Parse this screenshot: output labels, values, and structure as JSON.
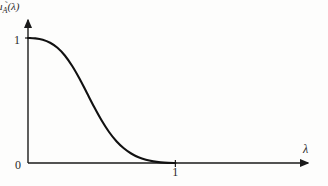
{
  "figure": {
    "background_color": "#fdfdfc",
    "ink_color": "#1a1a1a",
    "y_axis_caption": {
      "symbol": "μ",
      "subscript": "A",
      "subscript_accent": "̃",
      "argument": "(λ)",
      "full": "μ_Ã(λ)"
    },
    "x_axis_caption": "λ",
    "origin_label": "0",
    "y_tick_one_label": "1",
    "x_tick_one_label": "1"
  },
  "chart_data": {
    "type": "line",
    "title": "",
    "xlabel": "λ",
    "ylabel": "μ_Ã(λ)",
    "xlim": [
      0,
      1.9
    ],
    "ylim": [
      0,
      1.12
    ],
    "grid": false,
    "legend": null,
    "xticks": [
      0,
      1
    ],
    "xticklabels": [
      "0",
      "1"
    ],
    "yticks": [
      0,
      1
    ],
    "yticklabels": [
      "0",
      "1"
    ],
    "series": [
      {
        "name": "membership function",
        "color": "#111111",
        "linewidth": 2.1,
        "x": [
          0.0,
          0.05,
          0.1,
          0.15,
          0.2,
          0.25,
          0.3,
          0.35,
          0.4,
          0.45,
          0.5,
          0.55,
          0.6,
          0.65,
          0.7,
          0.75,
          0.8,
          0.85,
          0.9,
          0.95,
          1.0
        ],
        "y": [
          1.0,
          0.997,
          0.986,
          0.962,
          0.922,
          0.86,
          0.776,
          0.674,
          0.56,
          0.446,
          0.34,
          0.248,
          0.174,
          0.118,
          0.076,
          0.046,
          0.026,
          0.013,
          0.005,
          0.001,
          0.0
        ]
      }
    ],
    "annotations": [
      {
        "text": "curve starts at value 1 when λ = 0"
      },
      {
        "text": "curve decays smoothly to 0 at λ = 1"
      }
    ]
  }
}
